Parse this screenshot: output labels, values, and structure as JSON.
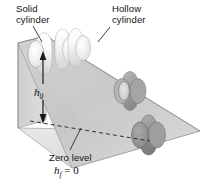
{
  "figure": {
    "type": "physics-diagram",
    "background_color": "#ffffff"
  },
  "labels": {
    "solid_cylinder": "Solid\ncylinder",
    "solid_cylinder_line1": "Solid",
    "solid_cylinder_line2": "cylinder",
    "hollow_cylinder_line1": "Hollow",
    "hollow_cylinder_line2": "cylinder",
    "zero_level": "Zero level",
    "height_symbol": "h",
    "height_subscript": "0",
    "final_height_symbol": "h",
    "final_height_subscript": "f",
    "final_height_equals": " = 0"
  },
  "colors": {
    "ramp_top_face": "#c9c9c9",
    "ramp_back_face": "#d5d5d5",
    "ramp_front_face": "#e3e3e3",
    "ramp_outline": "#8f8f8f",
    "cylinder_light": "#f2f2f2",
    "cylinder_dark": "#9a9a9a",
    "leader_line": "#2a2a2a",
    "text": "#131313"
  },
  "objects": [
    {
      "name": "solid-cylinder-top",
      "shade": "light",
      "position": "top of incline"
    },
    {
      "name": "hollow-cylinder-top",
      "shade": "light",
      "position": "top of incline"
    },
    {
      "name": "hollow-cylinder-mid",
      "shade": "medium",
      "position": "middle of incline"
    },
    {
      "name": "solid-cylinder-bottom",
      "shade": "dark",
      "position": "bottom of incline"
    }
  ],
  "annotations": {
    "height_arrow": "double-headed vertical arrow from zero level up to top of incline",
    "zero_level_line": "horizontal dashed reference line at base of incline"
  }
}
